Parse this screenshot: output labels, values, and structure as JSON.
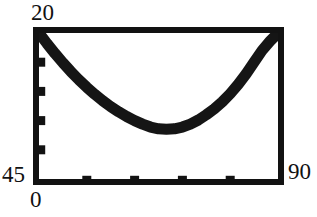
{
  "chart_data": {
    "type": "line",
    "title": "",
    "subtitle": "",
    "xlabel": "",
    "ylabel": "",
    "xlim": [
      0,
      90
    ],
    "ylim": [
      45,
      20
    ],
    "y_axis_inverted": true,
    "grid": false,
    "legend": null,
    "frame": "full-box",
    "tick_direction": "in",
    "x_tick_count": 4,
    "y_tick_count": 4,
    "series": [
      {
        "name": "arc",
        "x": [
          0,
          3,
          6,
          9,
          12,
          15,
          18,
          21,
          24,
          27,
          30,
          33,
          36,
          39,
          42,
          45,
          48,
          51,
          54,
          57,
          60,
          63,
          66,
          69,
          72,
          75,
          78,
          81,
          84,
          87,
          90
        ],
        "y": [
          45.0,
          43.2,
          41.5,
          39.9,
          38.4,
          37.0,
          35.7,
          34.5,
          33.4,
          32.4,
          31.5,
          30.7,
          30.0,
          29.4,
          28.9,
          28.6,
          28.5,
          28.6,
          28.9,
          29.4,
          30.1,
          31.0,
          32.0,
          33.2,
          34.6,
          36.2,
          38.0,
          40.0,
          42.0,
          43.6,
          45.0
        ]
      }
    ],
    "annotations": []
  },
  "axes": {
    "y_top_label": "20",
    "y_bottom_label": "45",
    "x_left_label": "0",
    "x_right_label": "90"
  },
  "colors": {
    "frame": "#121212",
    "curve": "#151515",
    "background": "#ffffff",
    "text": "#111111"
  }
}
